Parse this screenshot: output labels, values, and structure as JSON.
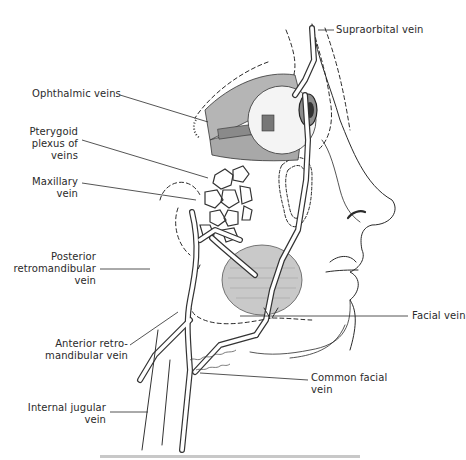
{
  "figure": {
    "labels": {
      "supraorbital": [
        "Supraorbital vein"
      ],
      "ophthalmic": [
        "Ophthalmic veins"
      ],
      "pterygoid": [
        "Pterygoid",
        "plexus of",
        "veins"
      ],
      "maxillary": [
        "Maxillary",
        "vein"
      ],
      "posterior_retro": [
        "Posterior",
        "retromandibular",
        "vein"
      ],
      "anterior_retro": [
        "Anterior retro-",
        "mandibular vein"
      ],
      "facial": [
        "Facial vein"
      ],
      "common_facial": [
        "Common facial",
        "vein"
      ],
      "internal_jugular": [
        "Internal jugular",
        "vein"
      ]
    },
    "colors": {
      "ink": "#2a2a2a",
      "shade": "#9a9a9a",
      "muscle": "#bdbdbd",
      "background": "#ffffff"
    }
  }
}
